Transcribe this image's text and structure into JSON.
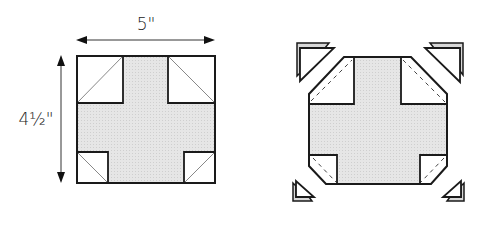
{
  "diagram": {
    "left_block": {
      "width_label": "5\"",
      "height_label": "4½\"",
      "description": "Cross block with four corner squares each split diagonally"
    },
    "right_block": {
      "description": "Same block with corner triangles trimmed off along dashed stitch lines",
      "removed_pieces": 4
    },
    "colors": {
      "outline": "#1a1a1a",
      "fill_gray": "#e3e3e3",
      "diagonal": "#888888",
      "background": "#ffffff"
    }
  }
}
